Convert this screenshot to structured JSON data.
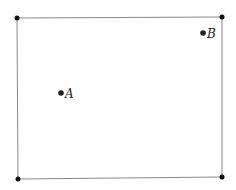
{
  "diagram": {
    "type": "rectangle-with-points",
    "colors": {
      "line": "#888888",
      "dot": "#111111",
      "text": "#222222"
    },
    "corners": [
      {
        "name": "top-left",
        "x": 17,
        "y": 18
      },
      {
        "name": "top-right",
        "x": 222,
        "y": 17
      },
      {
        "name": "bottom-right",
        "x": 222,
        "y": 177
      },
      {
        "name": "bottom-left",
        "x": 18,
        "y": 179
      }
    ],
    "points": [
      {
        "label": "A",
        "x": 61,
        "y": 93
      },
      {
        "label": "B",
        "x": 203,
        "y": 33
      }
    ]
  }
}
